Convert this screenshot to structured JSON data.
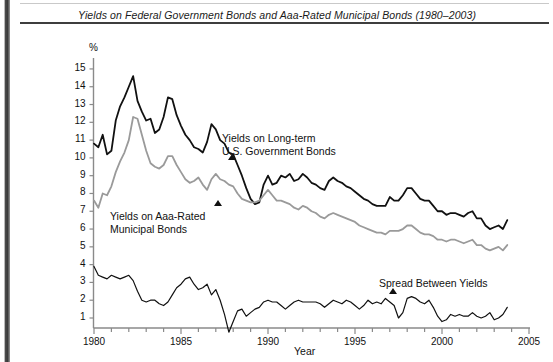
{
  "figure": {
    "title": "Yields on Federal Government Bonds and Aaa-Rated Municipal Bonds (1980–2003)"
  },
  "colors": {
    "government_line": "#111111",
    "municipal_line": "#9a9a9a",
    "spread_line": "#111111",
    "axis": "#8a8a8a",
    "text": "#111111"
  },
  "annotations": {
    "gov": {
      "line1": "Yields on Long-term",
      "line2": "U.S. Government Bonds"
    },
    "muni": {
      "line1": "Yields on Aaa-Rated",
      "line2": "Municipal Bonds"
    },
    "spread": {
      "line1": "Spread Between Yields"
    }
  },
  "chart_data": {
    "type": "line",
    "title": "Yields on Federal Government Bonds and Aaa-Rated Municipal Bonds (1980–2003)",
    "xlabel": "Year",
    "ylabel": "%",
    "xlim": [
      1980,
      2005
    ],
    "ylim": [
      0,
      15.6
    ],
    "grid": false,
    "legend": "annotations-inline",
    "xticks": [
      1980,
      1981,
      1982,
      1983,
      1984,
      1985,
      1986,
      1987,
      1988,
      1989,
      1990,
      1991,
      1992,
      1993,
      1994,
      1995,
      1996,
      1997,
      1998,
      1999,
      2000,
      2001,
      2002,
      2003,
      2004,
      2005
    ],
    "xticklabels": [
      "1980",
      "",
      "",
      "",
      "",
      "1985",
      "",
      "",
      "",
      "",
      "1990",
      "",
      "",
      "",
      "",
      "1995",
      "",
      "",
      "",
      "",
      "2000",
      "",
      "",
      "",
      "",
      "2005"
    ],
    "yticks": [
      1,
      2,
      3,
      4,
      5,
      6,
      7,
      8,
      9,
      10,
      11,
      12,
      13,
      14,
      15
    ],
    "yticklabels": [
      "1",
      "2",
      "3",
      "4",
      "5",
      "6",
      "7",
      "8",
      "9",
      "10",
      "11",
      "12",
      "13",
      "14",
      "15"
    ],
    "x": [
      1980.0,
      1980.25,
      1980.5,
      1980.75,
      1981.0,
      1981.25,
      1981.5,
      1981.75,
      1982.0,
      1982.25,
      1982.5,
      1982.75,
      1983.0,
      1983.25,
      1983.5,
      1983.75,
      1984.0,
      1984.25,
      1984.5,
      1984.75,
      1985.0,
      1985.25,
      1985.5,
      1985.75,
      1986.0,
      1986.25,
      1986.5,
      1986.75,
      1987.0,
      1987.25,
      1987.5,
      1987.75,
      1988.0,
      1988.25,
      1988.5,
      1988.75,
      1989.0,
      1989.25,
      1989.5,
      1989.75,
      1990.0,
      1990.25,
      1990.5,
      1990.75,
      1991.0,
      1991.25,
      1991.5,
      1991.75,
      1992.0,
      1992.25,
      1992.5,
      1992.75,
      1993.0,
      1993.25,
      1993.5,
      1993.75,
      1994.0,
      1994.25,
      1994.5,
      1994.75,
      1995.0,
      1995.25,
      1995.5,
      1995.75,
      1996.0,
      1996.25,
      1996.5,
      1996.75,
      1997.0,
      1997.25,
      1997.5,
      1997.75,
      1998.0,
      1998.25,
      1998.5,
      1998.75,
      1999.0,
      1999.25,
      1999.5,
      1999.75,
      2000.0,
      2000.25,
      2000.5,
      2000.75,
      2001.0,
      2001.25,
      2001.5,
      2001.75,
      2002.0,
      2002.25,
      2002.5,
      2002.75,
      2003.0,
      2003.25,
      2003.5,
      2003.75
    ],
    "series": [
      {
        "name": "Yields on Long-term U.S. Government Bonds",
        "color": "#111111",
        "width": 1.8,
        "values": [
          10.8,
          10.6,
          11.3,
          10.2,
          10.4,
          12.1,
          12.9,
          13.4,
          14.0,
          14.6,
          13.2,
          12.6,
          12.1,
          12.2,
          11.4,
          11.6,
          12.3,
          13.4,
          13.3,
          12.4,
          11.8,
          11.3,
          11.0,
          10.6,
          10.5,
          10.3,
          10.9,
          11.9,
          11.6,
          11.0,
          10.8,
          10.3,
          10.2,
          9.6,
          9.0,
          8.3,
          7.7,
          7.4,
          7.5,
          8.5,
          9.0,
          8.5,
          8.6,
          9.0,
          8.9,
          9.1,
          8.7,
          8.8,
          9.1,
          8.9,
          8.6,
          8.5,
          8.3,
          8.2,
          8.7,
          8.9,
          8.7,
          8.6,
          8.4,
          8.3,
          8.1,
          7.9,
          7.7,
          7.6,
          7.4,
          7.3,
          7.3,
          7.3,
          7.8,
          7.6,
          7.6,
          7.9,
          8.3,
          8.3,
          8.0,
          7.7,
          7.6,
          7.6,
          7.3,
          7.0,
          7.0,
          6.8,
          6.9,
          6.9,
          6.8,
          6.7,
          6.9,
          7.0,
          6.6,
          6.6,
          6.2,
          6.0,
          6.1,
          6.2,
          6.0,
          6.5
        ],
        "units": "percent"
      },
      {
        "name": "Yields on Aaa-Rated Municipal Bonds",
        "color": "#9a9a9a",
        "width": 1.8,
        "values": [
          7.6,
          7.2,
          8.0,
          7.9,
          8.4,
          9.2,
          9.8,
          10.3,
          11.0,
          12.3,
          12.2,
          11.3,
          10.4,
          9.7,
          9.5,
          9.4,
          9.6,
          10.1,
          10.1,
          9.6,
          9.2,
          8.8,
          8.6,
          8.7,
          8.9,
          8.5,
          8.2,
          8.8,
          9.1,
          8.8,
          8.7,
          8.5,
          8.4,
          8.0,
          7.7,
          7.6,
          7.5,
          7.5,
          7.6,
          7.9,
          8.2,
          7.9,
          7.6,
          7.6,
          7.5,
          7.4,
          7.2,
          7.1,
          7.3,
          7.2,
          7.0,
          6.9,
          6.7,
          6.6,
          6.8,
          6.9,
          6.8,
          6.7,
          6.6,
          6.5,
          6.4,
          6.2,
          6.1,
          6.0,
          5.9,
          5.8,
          5.8,
          5.7,
          5.9,
          5.9,
          5.9,
          6.0,
          6.2,
          6.2,
          6.0,
          5.8,
          5.7,
          5.7,
          5.6,
          5.4,
          5.4,
          5.3,
          5.4,
          5.4,
          5.3,
          5.2,
          5.3,
          5.4,
          5.1,
          5.1,
          4.9,
          4.8,
          4.9,
          5.0,
          4.8,
          5.1
        ],
        "units": "percent"
      },
      {
        "name": "Spread Between Yields",
        "color": "#111111",
        "width": 1.2,
        "values": [
          3.9,
          3.4,
          3.3,
          3.2,
          3.4,
          3.3,
          3.2,
          3.3,
          3.4,
          3.1,
          2.5,
          2.0,
          1.9,
          2.0,
          2.0,
          1.8,
          1.7,
          1.9,
          2.3,
          2.7,
          2.9,
          3.2,
          3.3,
          2.9,
          2.6,
          2.7,
          2.9,
          2.3,
          2.6,
          2.0,
          1.2,
          0.2,
          0.8,
          1.4,
          1.5,
          1.1,
          1.3,
          1.5,
          1.6,
          1.9,
          2.0,
          1.9,
          1.9,
          1.7,
          1.5,
          1.7,
          1.9,
          2.0,
          1.9,
          1.9,
          1.9,
          1.9,
          1.8,
          1.6,
          1.8,
          2.0,
          1.9,
          1.8,
          2.0,
          1.9,
          1.7,
          1.5,
          1.7,
          2.0,
          1.8,
          1.9,
          1.8,
          2.1,
          1.9,
          1.7,
          1.0,
          1.3,
          2.1,
          2.2,
          2.1,
          1.9,
          1.8,
          2.0,
          1.6,
          1.1,
          0.8,
          0.9,
          1.2,
          1.1,
          1.2,
          1.1,
          1.1,
          1.3,
          1.1,
          1.0,
          1.1,
          1.3,
          0.9,
          1.0,
          1.2,
          1.6
        ],
        "units": "percentage points"
      }
    ]
  }
}
